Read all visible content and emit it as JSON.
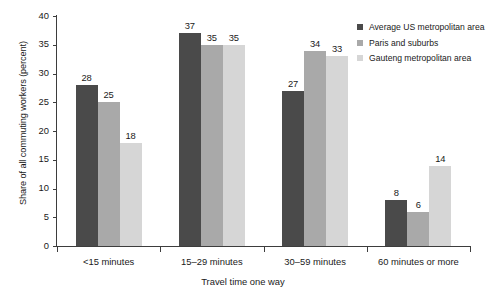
{
  "chart_data": {
    "type": "bar",
    "title": "",
    "xlabel": "Travel time one way",
    "ylabel": "Share of all commuting workers (percent)",
    "categories": [
      "<15 minutes",
      "15–29 minutes",
      "30–59 minutes",
      "60 minutes or more"
    ],
    "series": [
      {
        "name": "Average US metropolitan area",
        "color": "#4a4a4a",
        "values": [
          28,
          37,
          27,
          8
        ]
      },
      {
        "name": "Paris and suburbs",
        "color": "#a9a9a9",
        "values": [
          25,
          35,
          34,
          6
        ]
      },
      {
        "name": "Gauteng metropolitan area",
        "color": "#d6d6d6",
        "values": [
          18,
          35,
          33,
          14
        ]
      }
    ],
    "ylim": [
      0,
      40
    ],
    "yticks": [
      0,
      5,
      10,
      15,
      20,
      25,
      30,
      35,
      40
    ],
    "ytick_labels": [
      "0",
      "5",
      "10",
      "15",
      "20",
      "25",
      "30",
      "35",
      "40"
    ],
    "grid": false,
    "legend_position": "top-right",
    "data_labels": true
  },
  "legend": {
    "items": [
      {
        "label": "Average US metropolitan area",
        "color": "#4a4a4a"
      },
      {
        "label": "Paris and suburbs",
        "color": "#a9a9a9"
      },
      {
        "label": "Gauteng metropolitan area",
        "color": "#d6d6d6"
      }
    ]
  }
}
